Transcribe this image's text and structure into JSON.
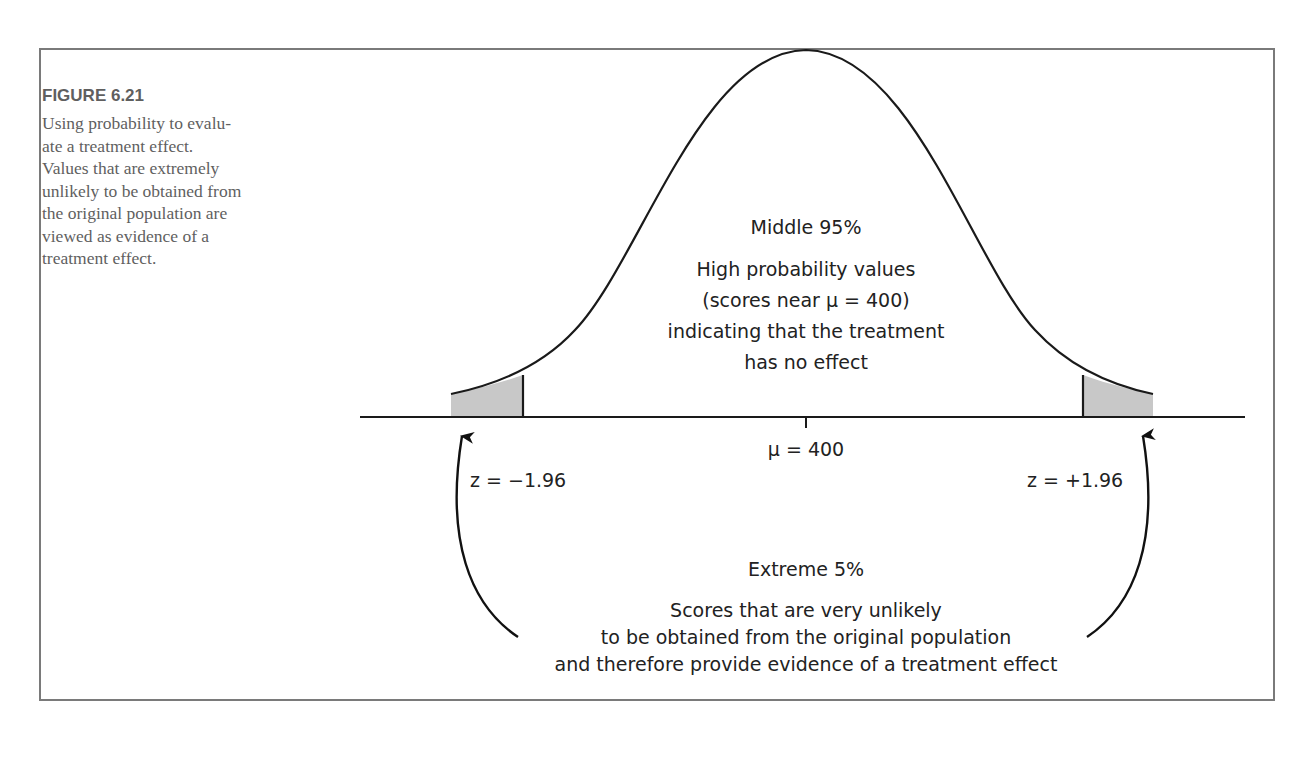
{
  "figure": {
    "title": "FIGURE 6.21",
    "caption_lines": [
      "Using probability to evalu-",
      "ate a treatment effect.",
      "Values that are extremely",
      "unlikely to be obtained from",
      "the original population are",
      "viewed as evidence of a",
      "treatment effect."
    ]
  },
  "diagram": {
    "middle_region": {
      "heading": "Middle 95%",
      "lines": [
        "High probability values",
        "(scores near μ = 400)",
        "indicating that the treatment",
        "has no effect"
      ]
    },
    "mean_label": "μ = 400",
    "left_cutoff": "z = −1.96",
    "right_cutoff": "z = +1.96",
    "tail_region": {
      "heading": "Extreme 5%",
      "lines": [
        "Scores that are very unlikely",
        "to be obtained from the original population",
        "and therefore provide evidence of a treatment effect"
      ]
    },
    "colors": {
      "curve": "#1a1a1a",
      "tail_fill": "#c8c8c8",
      "frame": "#7a7a7a"
    }
  }
}
